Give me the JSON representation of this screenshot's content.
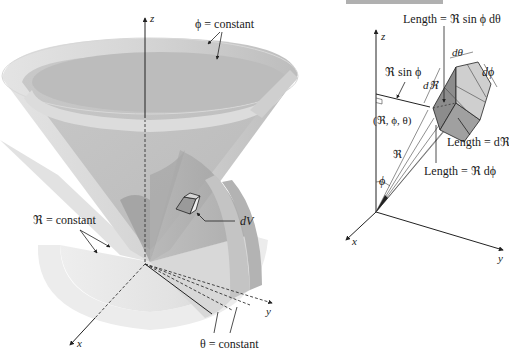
{
  "figure_left": {
    "title": "Spherical coordinate surfaces",
    "axis_labels": {
      "z": "z",
      "x": "x",
      "y": "y"
    },
    "labels": {
      "phi_constant": "ϕ = constant",
      "r_constant": "ℜ = constant",
      "theta_constant": "θ = constant",
      "dV": "dV"
    }
  },
  "figure_right": {
    "title": "Differential volume element",
    "header_strip_color": "#b0b0b0",
    "axis_labels": {
      "z": "z",
      "x": "x",
      "y": "y"
    },
    "labels": {
      "length_top": "Length = ℜ sin ϕ dθ",
      "r_sin_phi": "ℜ sin ϕ",
      "d_theta": "dθ",
      "d_phi": "dϕ",
      "d_r": "dℜ",
      "point": "(ℜ, ϕ, θ)",
      "length_dr": "Length = dℜ",
      "length_r_dphi": "Length = ℜ dϕ",
      "r": "ℜ",
      "phi": "ϕ"
    }
  },
  "colors": {
    "surface_light": "#e6e6e6",
    "surface_mid": "#cfcfcf",
    "surface_dark": "#a8a8a8",
    "box_dark": "#8c8c8c",
    "box_light": "#c8c8c8",
    "ink": "#1a1a1a"
  }
}
